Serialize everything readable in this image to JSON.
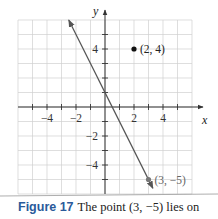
{
  "figure": {
    "label": "Figure 17",
    "caption": "The point (3, −5) lies on"
  },
  "chart_data": {
    "type": "line",
    "title": "",
    "xlabel": "x",
    "ylabel": "y",
    "xlim": [
      -6,
      6
    ],
    "ylim": [
      -6,
      6
    ],
    "grid": true,
    "x_ticks": [
      -4,
      -2,
      2,
      4
    ],
    "y_ticks": [
      4,
      -2,
      -4
    ],
    "x_tick_labels": [
      "−4",
      "−2",
      "2",
      "4"
    ],
    "y_tick_labels": [
      "4",
      "−2",
      "−4"
    ],
    "series": [
      {
        "name": "line",
        "equation": "y = -2x + 1",
        "slope": -2,
        "intercept": 1,
        "x": [
          -2.5,
          3.3
        ],
        "y": [
          6,
          -5.6
        ],
        "arrows": "both",
        "color": "#555555"
      }
    ],
    "points": [
      {
        "x": 2,
        "y": 4,
        "label": "(2, 4)",
        "color": "#111111"
      },
      {
        "x": 3,
        "y": -5,
        "label": "(3, −5)",
        "color": "#777777"
      }
    ],
    "colors": {
      "grid": "#d0d0d0",
      "axes": "#333333",
      "caption_label": "#2a5a9a"
    }
  }
}
